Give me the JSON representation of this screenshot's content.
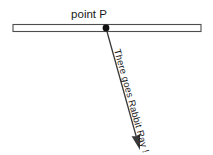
{
  "canvas": {
    "width": 213,
    "height": 155,
    "background_color": "#ffffff"
  },
  "diagram": {
    "type": "geometry-ray-diagram",
    "line": {
      "icon_name": "horizontal-line-bar",
      "x_start": 13,
      "x_end": 201,
      "y_top": 24.5,
      "y_bottom": 31.5,
      "stroke_color": "#4d4d4d",
      "fill_color": "#ffffff",
      "stroke_width": 1.1
    },
    "point": {
      "label": "point P",
      "dot_x": 106,
      "dot_y": 28,
      "dot_radius": 3.4,
      "dot_color": "#111111",
      "label_x": 89,
      "label_y": 18,
      "label_color": "#1a1a1a"
    },
    "ray": {
      "label": "There goes Rabbit Ray !",
      "from_x": 106,
      "from_y": 28,
      "to_x": 140,
      "to_y": 150,
      "stroke_color": "#3a3a3a",
      "stroke_width": 1.3,
      "angle_degrees": 74.4,
      "arrowhead": "filled-triangle",
      "label_color": "#2b2b2b",
      "label_offset_x": 8,
      "label_offset_y": 22
    }
  }
}
